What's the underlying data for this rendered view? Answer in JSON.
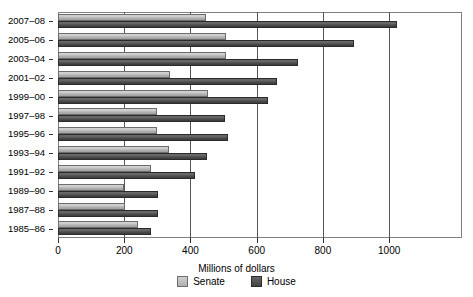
{
  "chart_data": {
    "type": "bar",
    "orientation": "horizontal",
    "title": "",
    "xlabel": "Millions of dollars",
    "ylabel": "",
    "xlim": [
      0,
      1220
    ],
    "xticks": [
      0,
      200,
      400,
      600,
      800,
      1000
    ],
    "xticklabels": [
      "0",
      "200",
      "400",
      "600",
      "800",
      "1000"
    ],
    "grid": "vertical",
    "legend_position": "bottom-center",
    "categories": [
      "2007–08",
      "2005–06",
      "2003–04",
      "2001–02",
      "1999–00",
      "1997–98",
      "1995–96",
      "1993–94",
      "1991–92",
      "1989–90",
      "1987–88",
      "1985–86"
    ],
    "series": [
      {
        "name": "Senate",
        "color": "#c2c2c2",
        "values": [
          448,
          506,
          506,
          337,
          453,
          299,
          299,
          335,
          282,
          199,
          203,
          242
        ]
      },
      {
        "name": "House",
        "color": "#4d4d4d",
        "values": [
          1025,
          895,
          726,
          662,
          633,
          503,
          513,
          450,
          413,
          302,
          302,
          281
        ]
      }
    ]
  },
  "legend": {
    "items": [
      {
        "label": "Senate",
        "swatch": "senate"
      },
      {
        "label": "House",
        "swatch": "house"
      }
    ]
  }
}
